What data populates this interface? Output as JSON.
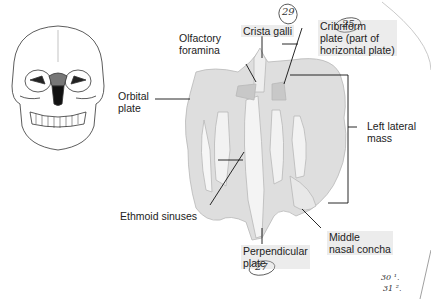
{
  "figure": {
    "inset": {
      "name": "skull-anterior-view",
      "highlight_color": "#777777"
    },
    "labels": [
      {
        "id": "olfactory-foramina",
        "text_lines": [
          "Olfactory",
          "foramina"
        ]
      },
      {
        "id": "crista-galli",
        "text_lines": [
          "Crista galli"
        ]
      },
      {
        "id": "cribriform-plate",
        "text_lines": [
          "Cribriform",
          "plate (part of",
          "horizontal plate)"
        ]
      },
      {
        "id": "orbital-plate",
        "text_lines": [
          "Orbital",
          "plate"
        ]
      },
      {
        "id": "left-lateral-mass",
        "text_lines": [
          "Left lateral",
          "mass"
        ]
      },
      {
        "id": "ethmoid-sinuses",
        "text_lines": [
          "Ethmoid sinuses"
        ]
      },
      {
        "id": "middle-nasal-concha",
        "text_lines": [
          "Middle",
          "nasal concha"
        ]
      },
      {
        "id": "perpendicular-plate",
        "text_lines": [
          "Perpendicular",
          "plate"
        ]
      }
    ],
    "handwritten": {
      "crista_galli_number": "29",
      "cribriform_mark": "25",
      "perpendicular_number": "27",
      "note_line1": "30 ¹.",
      "note_line2": "31 ².",
      "bone_color": "#d9d9d9"
    }
  }
}
